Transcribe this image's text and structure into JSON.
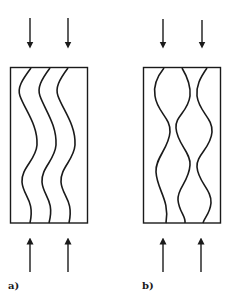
{
  "figure": {
    "panels": [
      {
        "id": "a",
        "label": "a)",
        "description": "parallel in-phase wavy flow channels"
      },
      {
        "id": "b",
        "label": "b)",
        "description": "mirror-symmetric wavy channels forming bulges and constrictions"
      }
    ],
    "arrows": {
      "top_direction": "down",
      "bottom_direction": "up",
      "count_per_panel_top": 2,
      "count_per_panel_bottom": 2
    },
    "colors": {
      "stroke": "#1a1a1a",
      "background": "#ffffff"
    }
  }
}
